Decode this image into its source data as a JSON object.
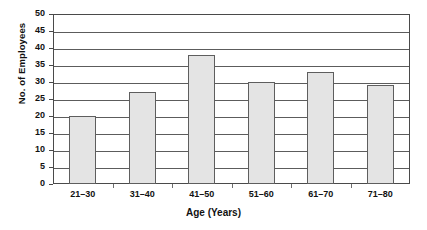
{
  "chart_data": {
    "type": "bar",
    "title": "",
    "categories": [
      "21–30",
      "31–40",
      "41–50",
      "51–60",
      "61–70",
      "71–80"
    ],
    "values": [
      20,
      27,
      38,
      30,
      33,
      29
    ],
    "series": [
      {
        "name": "No. of Employees",
        "values": [
          20,
          27,
          38,
          30,
          33,
          29
        ]
      }
    ],
    "xlabel": "Age (Years)",
    "ylabel": "No. of Employees",
    "ylim": [
      0,
      50
    ],
    "ytick_step": 5,
    "yticks": [
      0,
      5,
      10,
      15,
      20,
      25,
      30,
      35,
      40,
      45,
      50
    ],
    "ytick_labels": [
      "0",
      "5",
      "10",
      "15",
      "20",
      "25",
      "30",
      "35",
      "40",
      "45",
      "50"
    ],
    "grid": true,
    "grid_axis": "y",
    "legend": false,
    "legend_position": "none",
    "bar_fill_color": "#e4e4e4",
    "bar_border_color": "#5e5e5e",
    "plot_background": "#ffffff",
    "axis_color": "#4a4a4a"
  }
}
